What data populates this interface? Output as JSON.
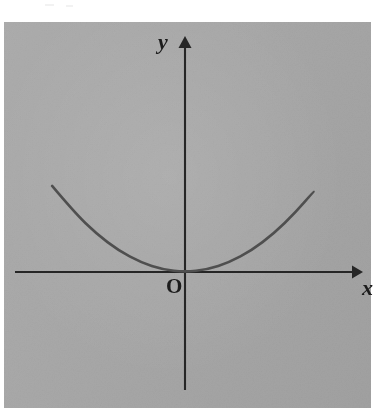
{
  "figure": {
    "kind": "cartesian-plot",
    "background_color": "#a8a8a8",
    "page_color": "#ffffff",
    "axis_color": "#262626",
    "curve_color": "#4f4f4f"
  },
  "labels": {
    "y_axis": "y",
    "x_axis": "x",
    "origin": "O"
  },
  "chart_data": {
    "type": "line",
    "title": "",
    "xlabel": "x",
    "ylabel": "y",
    "subtitle": "",
    "annotations": [
      "O"
    ],
    "legend": [],
    "legend_position": "none",
    "grid": false,
    "axis_arrows": {
      "x": "right",
      "y": "up"
    },
    "origin_label": "O",
    "xlim": [
      -4.3,
      6.2
    ],
    "ylim": [
      -3.4,
      5.4
    ],
    "xticks": [],
    "yticks": [],
    "series": [
      {
        "name": "parabola",
        "equation": "y = a*x^2 (a > 0), vertex at origin, tangent to x-axis",
        "vertex": [
          0,
          0
        ],
        "x": [
          -3.0,
          -2.5,
          -2.0,
          -1.5,
          -1.0,
          -0.5,
          0.0,
          0.5,
          1.0,
          1.5,
          2.0,
          2.5,
          2.9
        ],
        "y": [
          2.7,
          1.875,
          1.2,
          0.675,
          0.3,
          0.075,
          0.0,
          0.075,
          0.3,
          0.675,
          1.2,
          1.875,
          2.52
        ]
      }
    ]
  }
}
